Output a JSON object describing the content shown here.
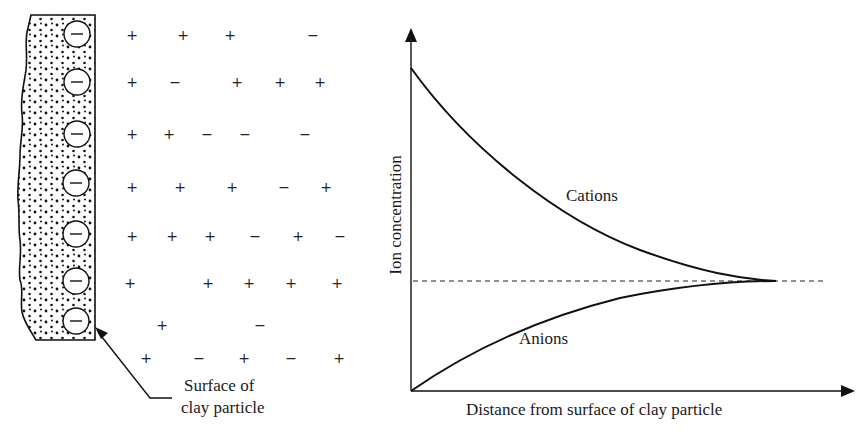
{
  "left_panel": {
    "callout_label_line1": "Surface of",
    "callout_label_line2": "clay particle",
    "surface_charges": [
      "−",
      "−",
      "−",
      "−",
      "−",
      "−",
      "−"
    ],
    "ion_rows": [
      {
        "y": 35,
        "ions": [
          {
            "x": 132,
            "s": "+"
          },
          {
            "x": 183,
            "s": "+"
          },
          {
            "x": 230,
            "s": "+"
          },
          {
            "x": 313,
            "s": "−"
          }
        ]
      },
      {
        "y": 82,
        "ions": [
          {
            "x": 132,
            "s": "+"
          },
          {
            "x": 175,
            "s": "−"
          },
          {
            "x": 237,
            "s": "+"
          },
          {
            "x": 280,
            "s": "+"
          },
          {
            "x": 320,
            "s": "+"
          }
        ]
      },
      {
        "y": 134,
        "ions": [
          {
            "x": 132,
            "s": "+"
          },
          {
            "x": 169,
            "s": "+"
          },
          {
            "x": 207,
            "s": "−"
          },
          {
            "x": 245,
            "s": "−"
          },
          {
            "x": 305,
            "s": "−"
          }
        ]
      },
      {
        "y": 187,
        "ions": [
          {
            "x": 132,
            "s": "+"
          },
          {
            "x": 180,
            "s": "+"
          },
          {
            "x": 232,
            "s": "+"
          },
          {
            "x": 284,
            "s": "−"
          },
          {
            "x": 326,
            "s": "+"
          }
        ]
      },
      {
        "y": 236,
        "ions": [
          {
            "x": 132,
            "s": "+"
          },
          {
            "x": 172,
            "s": "+"
          },
          {
            "x": 210,
            "s": "+"
          },
          {
            "x": 255,
            "s": "−"
          },
          {
            "x": 298,
            "s": "+"
          },
          {
            "x": 340,
            "s": "−"
          }
        ]
      },
      {
        "y": 283,
        "ions": [
          {
            "x": 130,
            "s": "+"
          },
          {
            "x": 208,
            "s": "+"
          },
          {
            "x": 249,
            "s": "+"
          },
          {
            "x": 291,
            "s": "+"
          },
          {
            "x": 337,
            "s": "+"
          }
        ]
      },
      {
        "y": 325,
        "ions": [
          {
            "x": 162,
            "s": "+"
          },
          {
            "x": 260,
            "s": "−"
          }
        ]
      },
      {
        "y": 358,
        "ions": [
          {
            "x": 146,
            "s": "+"
          },
          {
            "x": 199,
            "s": "−"
          },
          {
            "x": 244,
            "s": "+"
          },
          {
            "x": 291,
            "s": "−"
          },
          {
            "x": 339,
            "s": "+"
          }
        ]
      }
    ]
  },
  "chart_data": {
    "type": "line",
    "title": "",
    "xlabel": "Distance from surface of clay particle",
    "ylabel": "Ion concentration",
    "grid": false,
    "axis_ticks": "none",
    "series": [
      {
        "name": "Cations",
        "x": [
          0,
          0.2,
          0.4,
          0.6,
          0.8,
          0.83
        ],
        "y": [
          0.9,
          0.62,
          0.44,
          0.33,
          0.3,
          0.3
        ],
        "style": "solid, decaying to equilibrium"
      },
      {
        "name": "Anions",
        "x": [
          0,
          0.2,
          0.4,
          0.6,
          0.8,
          0.83
        ],
        "y": [
          0.0,
          0.14,
          0.23,
          0.28,
          0.3,
          0.3
        ],
        "style": "solid, rising to equilibrium"
      }
    ],
    "reference_line": {
      "y": 0.3,
      "style": "dashed",
      "meaning": "bulk concentration"
    },
    "annotations": [
      "Cations",
      "Anions"
    ]
  }
}
